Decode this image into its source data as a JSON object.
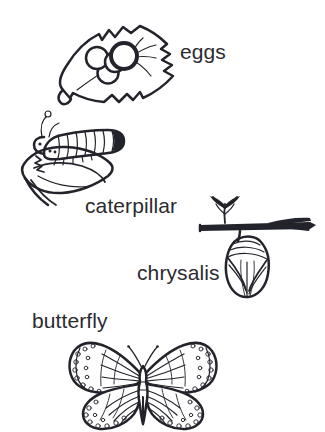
{
  "diagram": {
    "background_color": "#ffffff",
    "ink_color": "#23232b",
    "label_color": "#2b2b2f",
    "style": "black-and-white line drawing"
  },
  "stages": [
    {
      "id": "eggs",
      "label": "eggs",
      "order": 1,
      "illustration": "butterfly-eggs-on-leaf",
      "description": "Four round eggs clustered on a leaf with veins",
      "egg_count": 4,
      "label_position": "right"
    },
    {
      "id": "caterpillar",
      "label": "caterpillar",
      "order": 2,
      "illustration": "caterpillar-on-chewed-leaf",
      "description": "Segmented caterpillar with antennae eating a leaf",
      "label_position": "below"
    },
    {
      "id": "chrysalis",
      "label": "chrysalis",
      "order": 3,
      "illustration": "chrysalis-hanging-from-twig",
      "description": "Chrysalis suspended from a horizontal twig with a leaf sprig",
      "label_position": "left"
    },
    {
      "id": "butterfly",
      "label": "butterfly",
      "order": 4,
      "illustration": "monarch-butterfly-wings-spread",
      "description": "Monarch butterfly with spotted wing margins and radiating veins",
      "label_position": "above"
    }
  ]
}
